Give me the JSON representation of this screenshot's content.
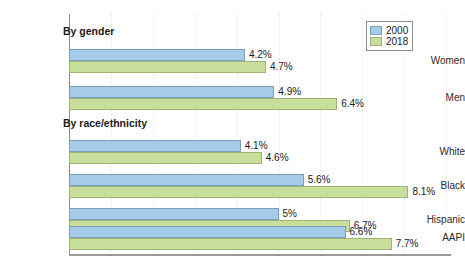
{
  "chart_data": {
    "type": "bar",
    "orientation": "horizontal",
    "title": "",
    "xlabel": "",
    "ylabel": "",
    "xlim": [
      0,
      9
    ],
    "grid": true,
    "grid_axis": "x",
    "grid_interval": 1,
    "legend_position": "top-right",
    "value_suffix": "%",
    "categories": [
      "Women",
      "Men",
      "White",
      "Black",
      "Hispanic",
      "AAPI"
    ],
    "series": [
      {
        "name": "2000",
        "color": "#a6cbe8",
        "values": [
          4.2,
          4.9,
          4.1,
          5.6,
          5.0,
          6.6
        ]
      },
      {
        "name": "2018",
        "color": "#c8df9c",
        "values": [
          4.7,
          6.4,
          4.6,
          8.1,
          6.7,
          7.7
        ]
      }
    ],
    "sections": [
      {
        "header": "By gender",
        "categories": [
          "Women",
          "Men"
        ]
      },
      {
        "header": "By race/ethnicity",
        "categories": [
          "White",
          "Black",
          "Hispanic",
          "AAPI"
        ]
      }
    ],
    "rows": [
      {
        "label": "Women",
        "v2000": "4.2%",
        "v2018": "4.7%",
        "n2000": 4.2,
        "n2018": 4.7
      },
      {
        "label": "Men",
        "v2000": "4.9%",
        "v2018": "6.4%",
        "n2000": 4.9,
        "n2018": 6.4
      },
      {
        "label": "White",
        "v2000": "4.1%",
        "v2018": "4.6%",
        "n2000": 4.1,
        "n2018": 4.6
      },
      {
        "label": "Black",
        "v2000": "5.6%",
        "v2018": "8.1%",
        "n2000": 5.6,
        "n2018": 8.1
      },
      {
        "label": "Hispanic",
        "v2000": "5%",
        "v2018": "6.7%",
        "n2000": 5.0,
        "n2018": 6.7
      },
      {
        "label": "AAPI",
        "v2000": "6.6%",
        "v2018": "7.7%",
        "n2000": 6.6,
        "n2018": 7.7
      }
    ]
  },
  "legend": {
    "items": [
      {
        "label": "2000",
        "color": "#a6cbe8"
      },
      {
        "label": "2018",
        "color": "#c8df9c"
      }
    ]
  },
  "colors": {
    "series_2000": "#a6cbe8",
    "series_2018": "#c8df9c",
    "axis": "#8a8a8a",
    "grid": "#d8d8d8",
    "text": "#1a1a1a",
    "background": "#ffffff"
  }
}
